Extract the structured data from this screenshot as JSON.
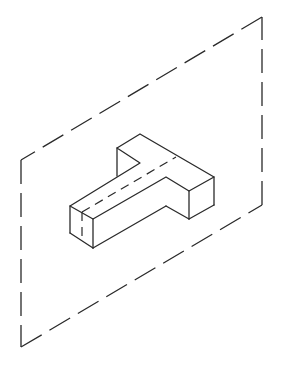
{
  "figure": {
    "plane": {
      "style": "dashed",
      "corners": [
        [
          262,
          17
        ],
        [
          21,
          160
        ],
        [
          21,
          347
        ],
        [
          262,
          205
        ]
      ]
    },
    "object": {
      "shape": "T-block",
      "visible_edges": [
        [
          [
            117,
            148
          ],
          [
            140,
            134
          ]
        ],
        [
          [
            140,
            134
          ],
          [
            214,
            177
          ]
        ],
        [
          [
            117,
            148
          ],
          [
            117,
            176
          ]
        ],
        [
          [
            117,
            148
          ],
          [
            140,
            163
          ]
        ],
        [
          [
            140,
            163
          ],
          [
            70,
            206
          ]
        ],
        [
          [
            70,
            206
          ],
          [
            93,
            219
          ]
        ],
        [
          [
            93,
            219
          ],
          [
            166,
            177
          ]
        ],
        [
          [
            166,
            177
          ],
          [
            189,
            191
          ]
        ],
        [
          [
            189,
            191
          ],
          [
            214,
            177
          ]
        ],
        [
          [
            214,
            177
          ],
          [
            214,
            205
          ]
        ],
        [
          [
            214,
            205
          ],
          [
            189,
            219
          ]
        ],
        [
          [
            189,
            191
          ],
          [
            189,
            219
          ]
        ],
        [
          [
            189,
            219
          ],
          [
            166,
            206
          ]
        ],
        [
          [
            166,
            206
          ],
          [
            93,
            248
          ]
        ],
        [
          [
            93,
            219
          ],
          [
            93,
            248
          ]
        ],
        [
          [
            70,
            206
          ],
          [
            70,
            233
          ]
        ],
        [
          [
            70,
            233
          ],
          [
            93,
            248
          ]
        ]
      ],
      "hidden_edges": [
        [
          [
            82,
            212
          ],
          [
            176,
            157
          ]
        ],
        [
          [
            82,
            212
          ],
          [
            82,
            240
          ]
        ]
      ]
    }
  }
}
